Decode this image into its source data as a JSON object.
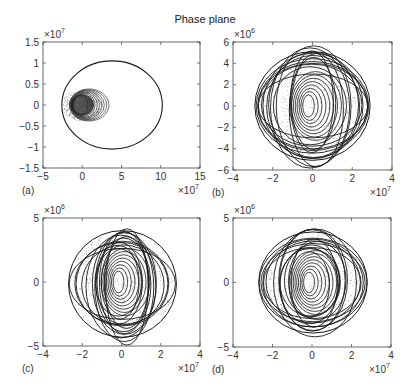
{
  "figure": {
    "title": "Phase plane"
  },
  "chart_data": [
    {
      "type": "line",
      "panel_label": "(a)",
      "title": "",
      "xlabel": "",
      "ylabel": "",
      "xlim": [
        -5,
        15
      ],
      "ylim": [
        -1.5,
        1.5
      ],
      "x_ticks": [
        -5,
        0,
        5,
        10,
        15
      ],
      "x_tick_labels": [
        "−5",
        "0",
        "5",
        "10",
        "15"
      ],
      "y_ticks": [
        -1.5,
        -1,
        -0.5,
        0,
        0.5,
        1,
        1.5
      ],
      "y_tick_labels": [
        "−1.5",
        "−1",
        "−0.5",
        "0",
        "0.5",
        "1",
        "1.5"
      ],
      "x_multiplier": "×10^7",
      "y_multiplier": "×10^7",
      "grid": false,
      "description": "Large outer orbit ellipse plus dense cluster of loops near origin",
      "series": [
        {
          "name": "outer orbit",
          "center": [
            3.8,
            0
          ],
          "rx": 6.4,
          "ry": 1.05
        },
        {
          "name": "inner cluster",
          "center": [
            0,
            0
          ],
          "rx": 2.7,
          "ry": 0.4,
          "loops": 10
        }
      ]
    },
    {
      "type": "line",
      "panel_label": "(b)",
      "xlim": [
        -4,
        4
      ],
      "ylim": [
        -6,
        6
      ],
      "x_ticks": [
        -4,
        -2,
        0,
        2,
        4
      ],
      "x_tick_labels": [
        "−4",
        "−2",
        "0",
        "2",
        "4"
      ],
      "y_ticks": [
        -6,
        -4,
        -2,
        0,
        2,
        4,
        6
      ],
      "y_tick_labels": [
        "−6",
        "−4",
        "−2",
        "0",
        "2",
        "4",
        "6"
      ],
      "x_multiplier": "×10^7",
      "y_multiplier": "×10^6",
      "grid": false,
      "description": "Many overlapping elliptical trajectories centered near origin, radius up to ~2.9e7 by ~5.2e6",
      "series": [
        {
          "name": "trajectories",
          "x_extent": [
            -2.9,
            2.9
          ],
          "y_extent": [
            -5.2,
            5.2
          ],
          "loops": 14
        }
      ]
    },
    {
      "type": "line",
      "panel_label": "(c)",
      "xlim": [
        -4,
        4
      ],
      "ylim": [
        -5,
        5
      ],
      "x_ticks": [
        -4,
        -2,
        0,
        2,
        4
      ],
      "x_tick_labels": [
        "−4",
        "−2",
        "0",
        "2",
        "4"
      ],
      "y_ticks": [
        -5,
        0,
        5
      ],
      "y_tick_labels": [
        "−5",
        "0",
        "5"
      ],
      "x_multiplier": "×10^7",
      "y_multiplier": "×10^6",
      "grid": false,
      "description": "Overlapping elliptical trajectories, x from ~-2.7e7 to 2.8e7, y ~ ±4.4e6",
      "series": [
        {
          "name": "trajectories",
          "x_extent": [
            -2.7,
            2.8
          ],
          "y_extent": [
            -4.4,
            4.1
          ],
          "loops": 14
        }
      ]
    },
    {
      "type": "line",
      "panel_label": "(d)",
      "xlim": [
        -4,
        4
      ],
      "ylim": [
        -5,
        5
      ],
      "x_ticks": [
        -4,
        -2,
        0,
        2,
        4
      ],
      "x_tick_labels": [
        "−4",
        "−2",
        "0",
        "2",
        "4"
      ],
      "y_ticks": [
        -5,
        0,
        5
      ],
      "y_tick_labels": [
        "−5",
        "0",
        "5"
      ],
      "x_multiplier": "×10^7",
      "y_multiplier": "×10^6",
      "grid": false,
      "description": "Overlapping elliptical trajectories, x from ~-2.7e7 to 2.8e7, y ~ -4e6 to 4e6",
      "series": [
        {
          "name": "trajectories",
          "x_extent": [
            -2.7,
            2.8
          ],
          "y_extent": [
            -4.0,
            4.0
          ],
          "loops": 14
        }
      ]
    }
  ],
  "panels": [
    {
      "label": "(a)",
      "box": [
        43,
        42,
        200,
        168
      ]
    },
    {
      "label": "(b)",
      "box": [
        233,
        42,
        392,
        170
      ]
    },
    {
      "label": "(c)",
      "box": [
        43,
        218,
        200,
        346
      ]
    },
    {
      "label": "(d)",
      "box": [
        233,
        218,
        391,
        347
      ]
    }
  ],
  "colors": {
    "line": "#1a1a1a",
    "dots": "#555555",
    "axis": "#444444",
    "text": "#333333"
  }
}
